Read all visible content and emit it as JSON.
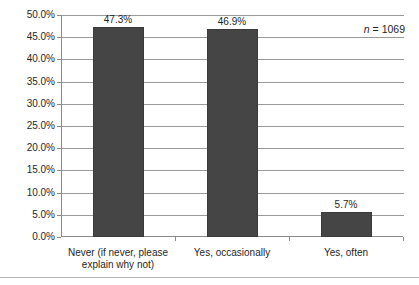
{
  "chart_data": {
    "type": "bar",
    "title": "",
    "subtitle": "",
    "xlabel": "",
    "ylabel": "",
    "categories": [
      "Never (if never, please explain why not)",
      "Yes, occasionally",
      "Yes, often"
    ],
    "values": [
      47.3,
      46.9,
      5.7
    ],
    "value_labels": [
      "47.3%",
      "46.9%",
      "5.7%"
    ],
    "ylim": [
      0,
      50
    ],
    "ytick_values": [
      50,
      45,
      40,
      35,
      30,
      25,
      20,
      15,
      10,
      5,
      0
    ],
    "ytick_labels": [
      "50.0%",
      "45.0%",
      "40.0%",
      "35.0%",
      "30.0%",
      "25.0%",
      "20.0%",
      "15.0%",
      "10.0%",
      "5.0%",
      "0.0%"
    ],
    "grid": true,
    "legend": false,
    "legend_position": "none",
    "bar_color": "#454545",
    "gridline_color": "#9a9a9a",
    "axis_color": "#8a8a8a",
    "background": "#ffffff"
  },
  "annotations": {
    "sample_size_symbol": "n",
    "sample_size_text": " = 1069",
    "sample_size_full": "n = 1069"
  },
  "category_label_lines": [
    [
      "Never (if never, please",
      "explain why not)"
    ],
    [
      "Yes, occasionally"
    ],
    [
      "Yes, often"
    ]
  ]
}
